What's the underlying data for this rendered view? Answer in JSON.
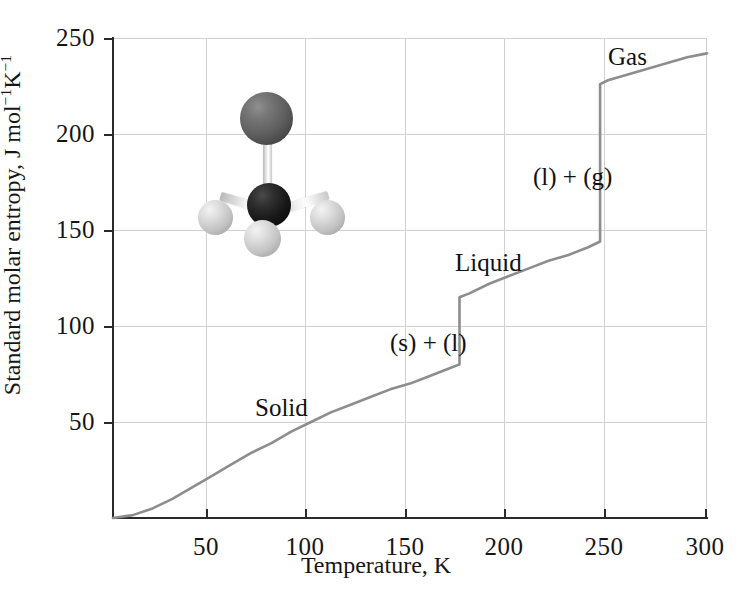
{
  "chart_data": {
    "type": "line",
    "title": "",
    "xlabel": "Temperature, K",
    "ylabel": "Standard molar entropy, J mol⁻¹K⁻¹",
    "xlim": [
      0,
      300
    ],
    "ylim": [
      0,
      250
    ],
    "xticks": [
      50,
      100,
      150,
      200,
      250,
      300
    ],
    "yticks": [
      50,
      100,
      150,
      200,
      250
    ],
    "grid": true,
    "legend": "none",
    "line_color": "#8d8d8d",
    "series": [
      {
        "name": "Standard molar entropy of methanol",
        "x": [
          0,
          10,
          20,
          30,
          40,
          50,
          60,
          70,
          80,
          90,
          100,
          110,
          120,
          130,
          140,
          150,
          160,
          170,
          175,
          175,
          180,
          190,
          200,
          210,
          220,
          230,
          240,
          246,
          246,
          250,
          260,
          270,
          280,
          290,
          300
        ],
        "y": [
          0,
          1.5,
          5,
          10,
          16,
          22,
          28,
          34,
          39,
          45,
          50,
          55,
          59,
          63,
          67,
          70,
          74,
          78,
          80,
          115,
          117,
          122,
          126,
          130,
          134,
          137,
          141,
          144,
          226,
          228,
          231,
          234,
          237,
          240,
          242
        ]
      }
    ],
    "transitions": [
      {
        "name": "melting",
        "temperature_k": 175,
        "entropy_before": 80,
        "entropy_after": 115
      },
      {
        "name": "vaporization",
        "temperature_k": 246,
        "entropy_before": 144,
        "entropy_after": 226
      }
    ],
    "annotations": [
      {
        "text": "Solid",
        "x_px": 290,
        "y_px": 408
      },
      {
        "text": "(s) + (l)",
        "x_px": 445,
        "y_px": 343
      },
      {
        "text": "Liquid",
        "x_px": 497,
        "y_px": 263
      },
      {
        "text": "(l) + (g)",
        "x_px": 588,
        "y_px": 177
      },
      {
        "text": "Gas",
        "x_px": 636,
        "y_px": 57
      }
    ]
  },
  "axes": {
    "xlabel": "Temperature, K",
    "ylabel_prefix": "Standard molar entropy, J mol",
    "ylabel_sup1": "−1",
    "ylabel_mid": "K",
    "ylabel_sup2": "−1",
    "xticklabels": [
      "50",
      "100",
      "150",
      "200",
      "250",
      "300"
    ],
    "yticklabels": [
      "250",
      "200",
      "150",
      "100",
      "50"
    ]
  },
  "annotations": {
    "solid": "Solid",
    "solid_liquid": "(s) + (l)",
    "liquid": "Liquid",
    "liquid_gas": "(l) + (g)",
    "gas": "Gas"
  },
  "molecule": {
    "name": "methanol-ball-and-stick-model",
    "atoms": [
      {
        "label": "oxygen-atom",
        "color": "#5e5e5e"
      },
      {
        "label": "carbon-atom",
        "color": "#161616"
      },
      {
        "label": "hydrogen-atom-left",
        "color": "#c2c2c2"
      },
      {
        "label": "hydrogen-atom-bottom",
        "color": "#c2c2c2"
      },
      {
        "label": "hydrogen-atom-right",
        "color": "#c2c2c2"
      }
    ]
  }
}
